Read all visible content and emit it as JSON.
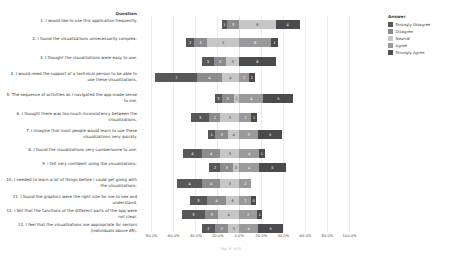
{
  "header": {
    "question_column_title": "Question",
    "caption": "Fig. 8. SUS"
  },
  "legend": {
    "title": "Answer",
    "items": [
      {
        "label": "Strongly Disagree",
        "color": "#58585a"
      },
      {
        "label": "Disagree",
        "color": "#8c8c8e"
      },
      {
        "label": "Neutral",
        "color": "#c6c6c7"
      },
      {
        "label": "Agree",
        "color": "#9a9a9c"
      },
      {
        "label": "Strongly Agree",
        "color": "#4b4b4d"
      }
    ]
  },
  "axis": {
    "ticks": [
      "-80.0%",
      "-60.0%",
      "-40.0%",
      "-20.0%",
      "0.0%",
      "20.0%",
      "40.0%",
      "60.0%",
      "80.0%",
      "100.0%"
    ],
    "tick_values": [
      -80,
      -60,
      -40,
      -20,
      0,
      20,
      40,
      60,
      80,
      100
    ],
    "min": -90,
    "max": 105
  },
  "chart_data": {
    "type": "bar",
    "subtype": "diverging-stacked-likert",
    "title": "",
    "xlabel": "",
    "ylabel": "Question",
    "xlim": [
      -90,
      105
    ],
    "grid": true,
    "legend_position": "right",
    "categories": [
      "1. I would like to use this application frequently.",
      "2. I found the visualizations unnecessarily complex.",
      "3. I thought the visualizations were easy to use.",
      "4. I would need the support of a technical person to be able to use these visualizations.",
      "5. The sequence of activities as I navigated the app made sense to me.",
      "6. I thought there was too much inconsistency between the visualizations.",
      "7. I imagine that most people would learn to use these visualizations very quickly.",
      "8. I found the visualizations very cumbersome to use.",
      "9. I felt very confident using the visualizations.",
      "10. I needed to learn a lot of things before I could get going with the visualizations.",
      "11. I found the graphics were the right size for me to see and understand.",
      "12. I felt that the functions of the different parts of the app were not clear.",
      "13. I feel that the visualizations are appropriate for seniors (individuals above 65)."
    ],
    "series": [
      {
        "name": "Strongly Disagree",
        "values": [
          1,
          2,
          3,
          7,
          3,
          3,
          1,
          4,
          2,
          4,
          3,
          3,
          2
        ]
      },
      {
        "name": "Disagree",
        "values": [
          3,
          3,
          3,
          4,
          3,
          2,
          3,
          4,
          3,
          4,
          4,
          3,
          3
        ]
      },
      {
        "name": "Neutral",
        "values": [
          6,
          5,
          3,
          4,
          2,
          3,
          4,
          3,
          3,
          3,
          6,
          4,
          3
        ]
      },
      {
        "name": "Agree",
        "values": [
          4,
          6,
          2,
          2,
          4,
          2,
          3,
          4,
          4,
          2,
          2,
          2,
          4
        ]
      },
      {
        "name": "Strongly Agree",
        "values": [
          4,
          1,
          6,
          1,
          5,
          1,
          5,
          1,
          5,
          1,
          0,
          1,
          5
        ]
      }
    ],
    "rows": [
      {
        "q": 1,
        "segments": [
          {
            "cat": "Strongly Disagree",
            "value": 1,
            "start": -16,
            "width": 5
          },
          {
            "cat": "Disagree",
            "value": 3,
            "start": -11,
            "width": 11
          },
          {
            "cat": "Neutral",
            "value": 6,
            "start": 0,
            "width": 33
          },
          {
            "cat": "Agree",
            "value": 4,
            "start": 33,
            "width": 0
          },
          {
            "cat": "Strongly Agree",
            "value": 4,
            "start": 33,
            "width": 22
          }
        ]
      },
      {
        "q": 2,
        "segments": [
          {
            "cat": "Strongly Disagree",
            "value": 2,
            "start": -48,
            "width": 7
          },
          {
            "cat": "Disagree",
            "value": 3,
            "start": -41,
            "width": 12
          },
          {
            "cat": "Neutral",
            "value": 5,
            "start": -29,
            "width": 29
          },
          {
            "cat": "Agree",
            "value": 6,
            "start": 0,
            "width": 29
          },
          {
            "cat": "Strongly Agree",
            "value": 1,
            "start": 29,
            "width": 6
          }
        ]
      },
      {
        "q": 3,
        "segments": [
          {
            "cat": "Strongly Disagree",
            "value": 3,
            "start": -34,
            "width": 11
          },
          {
            "cat": "Disagree",
            "value": 3,
            "start": -23,
            "width": 11
          },
          {
            "cat": "Neutral",
            "value": 3,
            "start": -12,
            "width": 12
          },
          {
            "cat": "Agree",
            "value": 2,
            "start": 0,
            "width": 0
          },
          {
            "cat": "Strongly Agree",
            "value": 6,
            "start": 0,
            "width": 33
          }
        ]
      },
      {
        "q": 4,
        "segments": [
          {
            "cat": "Strongly Disagree",
            "value": 7,
            "start": -76,
            "width": 38
          },
          {
            "cat": "Disagree",
            "value": 4,
            "start": -38,
            "width": 22
          },
          {
            "cat": "Neutral",
            "value": 4,
            "start": -16,
            "width": 16
          },
          {
            "cat": "Agree",
            "value": 2,
            "start": 0,
            "width": 9
          },
          {
            "cat": "Strongly Agree",
            "value": 1,
            "start": 9,
            "width": 5
          }
        ]
      },
      {
        "q": 5,
        "segments": [
          {
            "cat": "Strongly Disagree",
            "value": 3,
            "start": -22,
            "width": 6
          },
          {
            "cat": "Disagree",
            "value": 3,
            "start": -16,
            "width": 11
          },
          {
            "cat": "Neutral",
            "value": 2,
            "start": -5,
            "width": 5
          },
          {
            "cat": "Agree",
            "value": 4,
            "start": 0,
            "width": 22
          },
          {
            "cat": "Strongly Agree",
            "value": 5,
            "start": 22,
            "width": 27
          }
        ]
      },
      {
        "q": 6,
        "segments": [
          {
            "cat": "Strongly Disagree",
            "value": 3,
            "start": -44,
            "width": 17
          },
          {
            "cat": "Disagree",
            "value": 2,
            "start": -27,
            "width": 10
          },
          {
            "cat": "Neutral",
            "value": 3,
            "start": -17,
            "width": 17
          },
          {
            "cat": "Agree",
            "value": 2,
            "start": 0,
            "width": 11
          },
          {
            "cat": "Strongly Agree",
            "value": 1,
            "start": 11,
            "width": 5
          }
        ]
      },
      {
        "q": 7,
        "segments": [
          {
            "cat": "Strongly Disagree",
            "value": 1,
            "start": -28,
            "width": 6
          },
          {
            "cat": "Disagree",
            "value": 3,
            "start": -22,
            "width": 12
          },
          {
            "cat": "Neutral",
            "value": 4,
            "start": -10,
            "width": 10
          },
          {
            "cat": "Agree",
            "value": 3,
            "start": 0,
            "width": 17
          },
          {
            "cat": "Strongly Agree",
            "value": 5,
            "start": 17,
            "width": 22
          }
        ]
      },
      {
        "q": 8,
        "segments": [
          {
            "cat": "Strongly Disagree",
            "value": 4,
            "start": -51,
            "width": 17
          },
          {
            "cat": "Disagree",
            "value": 4,
            "start": -34,
            "width": 17
          },
          {
            "cat": "Neutral",
            "value": 3,
            "start": -17,
            "width": 17
          },
          {
            "cat": "Agree",
            "value": 4,
            "start": 0,
            "width": 18
          },
          {
            "cat": "Strongly Agree",
            "value": 1,
            "start": 18,
            "width": 5
          }
        ]
      },
      {
        "q": 9,
        "segments": [
          {
            "cat": "Strongly Disagree",
            "value": 2,
            "start": -27,
            "width": 10
          },
          {
            "cat": "Disagree",
            "value": 3,
            "start": -17,
            "width": 11
          },
          {
            "cat": "Neutral",
            "value": 3,
            "start": -6,
            "width": 6
          },
          {
            "cat": "Agree",
            "value": 4,
            "start": 0,
            "width": 18
          },
          {
            "cat": "Strongly Agree",
            "value": 5,
            "start": 18,
            "width": 24
          }
        ]
      },
      {
        "q": 10,
        "segments": [
          {
            "cat": "Strongly Disagree",
            "value": 4,
            "start": -56,
            "width": 22
          },
          {
            "cat": "Disagree",
            "value": 4,
            "start": -34,
            "width": 17
          },
          {
            "cat": "Neutral",
            "value": 3,
            "start": -17,
            "width": 17
          },
          {
            "cat": "Agree",
            "value": 2,
            "start": 0,
            "width": 11
          },
          {
            "cat": "Strongly Agree",
            "value": 1,
            "start": 11,
            "width": 0
          }
        ]
      },
      {
        "q": 11,
        "segments": [
          {
            "cat": "Strongly Disagree",
            "value": 3,
            "start": -45,
            "width": 16
          },
          {
            "cat": "Disagree",
            "value": 4,
            "start": -29,
            "width": 17
          },
          {
            "cat": "Neutral",
            "value": 6,
            "start": -12,
            "width": 12
          },
          {
            "cat": "Agree",
            "value": 2,
            "start": 0,
            "width": 11
          },
          {
            "cat": "Strongly Agree",
            "value": 0,
            "start": 11,
            "width": 4
          }
        ]
      },
      {
        "q": 12,
        "segments": [
          {
            "cat": "Strongly Disagree",
            "value": 3,
            "start": -52,
            "width": 21
          },
          {
            "cat": "Disagree",
            "value": 3,
            "start": -31,
            "width": 12
          },
          {
            "cat": "Neutral",
            "value": 4,
            "start": -19,
            "width": 19
          },
          {
            "cat": "Agree",
            "value": 2,
            "start": 0,
            "width": 16
          },
          {
            "cat": "Strongly Agree",
            "value": 1,
            "start": 16,
            "width": 5
          }
        ]
      },
      {
        "q": 13,
        "segments": [
          {
            "cat": "Strongly Disagree",
            "value": 2,
            "start": -34,
            "width": 12
          },
          {
            "cat": "Disagree",
            "value": 3,
            "start": -22,
            "width": 12
          },
          {
            "cat": "Neutral",
            "value": 3,
            "start": -10,
            "width": 10
          },
          {
            "cat": "Agree",
            "value": 4,
            "start": 0,
            "width": 17
          },
          {
            "cat": "Strongly Agree",
            "value": 5,
            "start": 17,
            "width": 23
          }
        ]
      }
    ]
  }
}
